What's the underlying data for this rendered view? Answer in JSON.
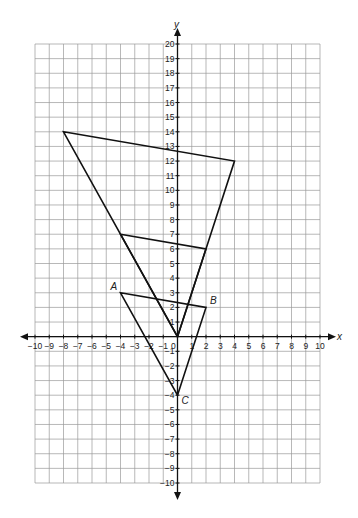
{
  "diagram": {
    "type": "coordinate-plane",
    "axes": {
      "x_label": "x",
      "y_label": "y",
      "x_range": [
        -10,
        10
      ],
      "y_range": [
        -10,
        20
      ],
      "origin_label": "0",
      "x_ticks": [
        "-10",
        "-9",
        "-8",
        "-7",
        "-6",
        "-5",
        "-4",
        "-3",
        "-2",
        "-1",
        "1",
        "2",
        "3",
        "4",
        "5",
        "6",
        "7",
        "8",
        "9",
        "10"
      ],
      "y_ticks": [
        "20",
        "19",
        "18",
        "17",
        "16",
        "15",
        "14",
        "13",
        "12",
        "11",
        "10",
        "9",
        "8",
        "7",
        "6",
        "5",
        "4",
        "3",
        "2",
        "1",
        "-1",
        "-2",
        "-3",
        "-4",
        "-5",
        "-6",
        "-7",
        "-8",
        "-9",
        "-10"
      ]
    },
    "triangles": [
      {
        "name": "triangle-ABC",
        "vertices": [
          [
            -4,
            3
          ],
          [
            2,
            2
          ],
          [
            0,
            -4
          ]
        ]
      },
      {
        "name": "triangle-small-dilation",
        "vertices": [
          [
            -4,
            7
          ],
          [
            2,
            6
          ],
          [
            0,
            0
          ]
        ]
      },
      {
        "name": "triangle-large-dilation",
        "vertices": [
          [
            -8,
            14
          ],
          [
            4,
            12
          ],
          [
            0,
            0
          ]
        ]
      }
    ],
    "point_labels": [
      {
        "text": "A",
        "x": -4,
        "y": 3
      },
      {
        "text": "B",
        "x": 2,
        "y": 2
      },
      {
        "text": "C",
        "x": 0,
        "y": -4
      }
    ],
    "colors": {
      "grid": "#9a9a9a",
      "axis": "#111111",
      "shape": "#111111"
    }
  }
}
